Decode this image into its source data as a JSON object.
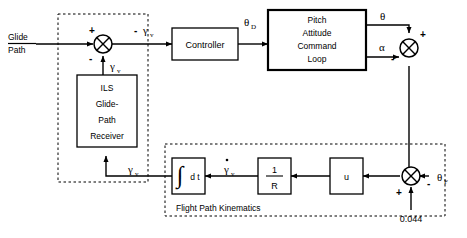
{
  "diagram": {
    "type": "control-block-diagram"
  },
  "inputs": {
    "glide_path_line1": "Glide",
    "glide_path_line2": "Path",
    "bias_value": "0.044"
  },
  "blocks": {
    "controller": {
      "label": "Controller"
    },
    "pitch_loop": {
      "line1": "Pitch",
      "line2": "Attitude",
      "line3": "Command",
      "line4": "Loop"
    },
    "ils_receiver": {
      "line1": "ILS",
      "line2": "Glide-",
      "line3": "Path",
      "line4": "Receiver"
    },
    "integrator": {
      "symbol": "∫",
      "label": "d t"
    },
    "one_over_r": {
      "numerator": "1",
      "denominator": "R"
    },
    "u_block": {
      "label": "u"
    }
  },
  "signals": {
    "gamma_v_error": "γ",
    "gamma_v_error_sub": "v",
    "gamma_v_error_sign": "-",
    "gamma_v_feedback_top": "γ",
    "gamma_v_feedback_top_sub": "v",
    "gamma_v_feedback_bottom": "γ",
    "gamma_v_feedback_bottom_sub": "v",
    "gamma_v_dot": "γ",
    "gamma_v_dot_sub": "v",
    "theta_d": "θ",
    "theta_d_sub": "D",
    "theta": "θ",
    "alpha": "α",
    "theta_f": "θ",
    "theta_f_sub": "F"
  },
  "summing_junctions": {
    "error_junction": {
      "plus": "+",
      "minus": "-"
    },
    "gamma_junction": {
      "plus": "+",
      "minus": "-"
    },
    "bias_junction": {
      "plus": "+",
      "minus": "-"
    }
  },
  "groups": {
    "guidance_group_label": "",
    "flight_path_label": "Flight Path Kinematics"
  }
}
